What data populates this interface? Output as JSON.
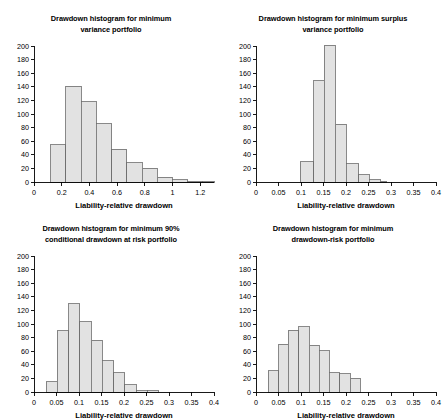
{
  "figure": {
    "background": "#ffffff",
    "bar_fill": "#e2e2e2",
    "bar_stroke": "#6b6b6b",
    "axis_color": "#000000"
  },
  "panels": [
    {
      "id": "minimum-variance",
      "title_line1": "Drawdown histogram for minimum",
      "title_line2": "variance portfolio",
      "xlabel": "Liability-relative drawdown",
      "yticks": [
        "0",
        "20",
        "40",
        "60",
        "80",
        "100",
        "120",
        "140",
        "160",
        "180",
        "200"
      ],
      "xticks": [
        "0",
        "0.2",
        "0.4",
        "0.6",
        "0.8",
        "1",
        "1.2"
      ]
    },
    {
      "id": "minimum-surplus-variance",
      "title_line1": "Drawdown histogram for minimum surplus",
      "title_line2": "variance portfolio",
      "xlabel": "Liability-relative drawdown",
      "yticks": [
        "0",
        "20",
        "40",
        "60",
        "80",
        "100",
        "120",
        "140",
        "160",
        "180",
        "200"
      ],
      "xticks": [
        "0",
        "0.05",
        "0.1",
        "0.15",
        "0.2",
        "0.25",
        "0.3",
        "0.35",
        "0.4"
      ]
    },
    {
      "id": "minimum-90-cdar",
      "title_line1": "Drawdown histogram for minimum 90%",
      "title_line2": "conditional drawdown at risk portfolio",
      "xlabel": "Liability-relative drawdown",
      "yticks": [
        "0",
        "20",
        "40",
        "60",
        "80",
        "100",
        "120",
        "140",
        "160",
        "180",
        "200"
      ],
      "xticks": [
        "0",
        "0.05",
        "0.1",
        "0.15",
        "0.2",
        "0.25",
        "0.3",
        "0.35",
        "0.4"
      ]
    },
    {
      "id": "minimum-drawdown-risk",
      "title_line1": "Drawdown histogram for minimum",
      "title_line2": "drawdown-risk portfolio",
      "xlabel": "Liability-relative drawdown",
      "yticks": [
        "0",
        "20",
        "40",
        "60",
        "80",
        "100",
        "120",
        "140",
        "160",
        "180",
        "200"
      ],
      "xticks": [
        "0",
        "0.05",
        "0.1",
        "0.15",
        "0.2",
        "0.25",
        "0.3",
        "0.35",
        "0.4"
      ]
    }
  ],
  "chart_data": [
    {
      "type": "bar",
      "title": "Drawdown histogram for minimum variance portfolio",
      "xlabel": "Liability-relative drawdown",
      "ylabel": "",
      "xlim": [
        0,
        1.3
      ],
      "ylim": [
        0,
        200
      ],
      "grid": false,
      "legend": null,
      "bin_edges": [
        0.12,
        0.23,
        0.34,
        0.45,
        0.56,
        0.67,
        0.78,
        0.89,
        1.0,
        1.11,
        1.22,
        1.3
      ],
      "bin_centers": [
        0.175,
        0.285,
        0.395,
        0.505,
        0.615,
        0.725,
        0.835,
        0.945,
        1.055,
        1.165,
        1.26
      ],
      "values": [
        55,
        141,
        118,
        86,
        48,
        28,
        20,
        7,
        3,
        1,
        1
      ]
    },
    {
      "type": "bar",
      "title": "Drawdown histogram for minimum surplus variance portfolio",
      "xlabel": "Liability-relative drawdown",
      "ylabel": "",
      "xlim": [
        0,
        0.4
      ],
      "ylim": [
        0,
        200
      ],
      "grid": false,
      "legend": null,
      "bin_edges": [
        0.098,
        0.128,
        0.152,
        0.176,
        0.2,
        0.228,
        0.252,
        0.276,
        0.29
      ],
      "bin_centers": [
        0.113,
        0.14,
        0.164,
        0.188,
        0.214,
        0.24,
        0.264,
        0.283
      ],
      "values": [
        30,
        149,
        201,
        85,
        27,
        11,
        3,
        1
      ]
    },
    {
      "type": "bar",
      "title": "Drawdown histogram for minimum 90% conditional drawdown at risk portfolio",
      "xlabel": "Liability-relative drawdown",
      "ylabel": "",
      "xlim": [
        0,
        0.4
      ],
      "ylim": [
        0,
        200
      ],
      "grid": false,
      "legend": null,
      "bin_edges": [
        0.027,
        0.052,
        0.077,
        0.102,
        0.127,
        0.152,
        0.177,
        0.202,
        0.227,
        0.252,
        0.277
      ],
      "bin_centers": [
        0.04,
        0.065,
        0.09,
        0.115,
        0.14,
        0.165,
        0.19,
        0.215,
        0.24,
        0.265
      ],
      "values": [
        15,
        90,
        130,
        103,
        76,
        46,
        28,
        11,
        2,
        2
      ]
    },
    {
      "type": "bar",
      "title": "Drawdown histogram for minimum drawdown-risk portfolio",
      "xlabel": "Liability-relative drawdown",
      "ylabel": "",
      "xlim": [
        0,
        0.4
      ],
      "ylim": [
        0,
        200
      ],
      "grid": false,
      "legend": null,
      "bin_edges": [
        0.027,
        0.05,
        0.072,
        0.095,
        0.118,
        0.14,
        0.163,
        0.186,
        0.209,
        0.232
      ],
      "bin_centers": [
        0.038,
        0.061,
        0.083,
        0.106,
        0.129,
        0.151,
        0.174,
        0.197,
        0.22
      ],
      "values": [
        31,
        70,
        91,
        96,
        69,
        61,
        28,
        27,
        20,
        10
      ]
    }
  ]
}
